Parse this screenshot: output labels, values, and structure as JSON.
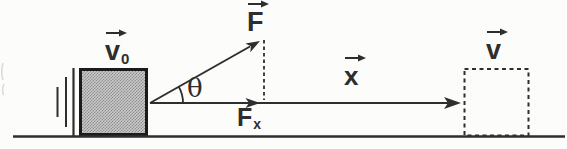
{
  "labels": {
    "initial_velocity": {
      "base": "v",
      "sub": "0",
      "vector": true
    },
    "applied_force": {
      "base": "F",
      "vector": true
    },
    "angle": {
      "base": "θ"
    },
    "force_x_component": {
      "base": "F",
      "sub": "x"
    },
    "displacement": {
      "base": "x",
      "vector": true
    },
    "final_velocity": {
      "base": "v",
      "vector": true
    }
  },
  "icons": {
    "vector_arrow": "→"
  },
  "colors": {
    "background": "#fcfcfb",
    "ink": "#2e2e2e",
    "block-border": "#1b1b1b",
    "block-light": "#c9c9c9",
    "block-dark": "#8f8f8f",
    "artifact": "#d9d9d9"
  }
}
